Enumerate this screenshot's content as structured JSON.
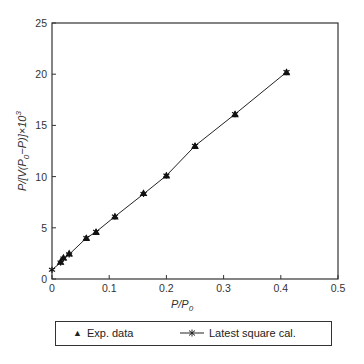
{
  "chart_data": {
    "type": "scatter",
    "title": "",
    "xlabel": "P/P0",
    "ylabel": "P/[V(P0-P)]x10^3",
    "xlim": [
      0,
      0.5
    ],
    "ylim": [
      0,
      25
    ],
    "x_ticks": [
      0,
      0.1,
      0.2,
      0.3,
      0.4,
      0.5
    ],
    "y_ticks": [
      0,
      5,
      10,
      15,
      20,
      25
    ],
    "grid": false,
    "legend_position": "bottom",
    "series": [
      {
        "name": "Exp. data",
        "type": "scatter",
        "marker": "triangle",
        "x": [
          0.015,
          0.02,
          0.03,
          0.06,
          0.077,
          0.11,
          0.16,
          0.2,
          0.25,
          0.32,
          0.41
        ],
        "y": [
          1.7,
          2.1,
          2.5,
          4.0,
          4.6,
          6.1,
          8.4,
          10.1,
          13.0,
          16.1,
          20.2
        ]
      },
      {
        "name": "Latest square cal.",
        "type": "line",
        "marker": "asterisk",
        "x": [
          0,
          0.015,
          0.02,
          0.03,
          0.06,
          0.077,
          0.11,
          0.16,
          0.2,
          0.25,
          0.32,
          0.41
        ],
        "y": [
          0.9,
          1.6,
          2.0,
          2.4,
          4.0,
          4.6,
          6.1,
          8.3,
          10.1,
          13.0,
          16.1,
          20.2
        ]
      }
    ]
  },
  "axes": {
    "x_label_main": "P/P",
    "x_label_sub": "0",
    "y_label_main": "P/[V(P",
    "y_label_sub": "0",
    "y_label_rest": "−P)]×10",
    "y_label_sup": "3",
    "x_tick_labels": [
      "0",
      "0.1",
      "0.2",
      "0.3",
      "0.4",
      "0.5"
    ],
    "y_tick_labels": [
      "0",
      "5",
      "10",
      "15",
      "20",
      "25"
    ]
  },
  "legend": {
    "exp_symbol": "▲",
    "exp_label": "Exp. data",
    "fit_label": "Latest square cal."
  },
  "colors": {
    "ink": "#222222",
    "axis": "#333333"
  }
}
